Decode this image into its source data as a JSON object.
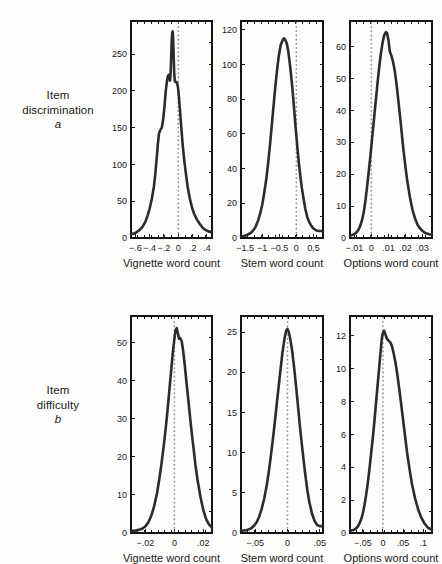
{
  "figure": {
    "background_color": "#fdfdfb",
    "curve_color": "#2b2b2b",
    "axis_color": "#141414",
    "zero_line_color": "#8a8a8a"
  },
  "rows": [
    {
      "line1": "Item",
      "line2": "discrimination",
      "symbol": "a"
    },
    {
      "line1": "Item",
      "line2": "difficulty",
      "symbol": "b"
    }
  ],
  "chart_data": [
    {
      "type": "line",
      "title": "",
      "panel": "top-left",
      "row": "Item discrimination a",
      "xlabel": "Vignette word count",
      "ylabel": "",
      "grid": false,
      "legend": "none",
      "xlim": [
        -0.66,
        0.47
      ],
      "ylim": [
        0,
        295
      ],
      "xticks": [
        -0.6,
        -0.4,
        -0.2,
        0,
        0.2,
        0.4
      ],
      "xticklabels": [
        "−.6",
        "−.4",
        "−.2",
        "0",
        ".2",
        ".4"
      ],
      "yticks": [
        0,
        50,
        100,
        150,
        200,
        250
      ],
      "yticklabels": [
        "0",
        "50",
        "100",
        "150",
        "200",
        "250"
      ],
      "annotations": [
        {
          "type": "vline",
          "x": 0,
          "style": "dotted"
        }
      ],
      "x": [
        -0.66,
        -0.62,
        -0.58,
        -0.54,
        -0.5,
        -0.46,
        -0.43,
        -0.4,
        -0.37,
        -0.34,
        -0.32,
        -0.3,
        -0.285,
        -0.27,
        -0.25,
        -0.23,
        -0.21,
        -0.19,
        -0.175,
        -0.16,
        -0.15,
        -0.14,
        -0.13,
        -0.122,
        -0.115,
        -0.108,
        -0.1,
        -0.092,
        -0.085,
        -0.078,
        -0.072,
        -0.065,
        -0.058,
        -0.05,
        -0.042,
        -0.035,
        -0.025,
        -0.015,
        -0.005,
        0.005,
        0.02,
        0.04,
        0.06,
        0.08,
        0.1,
        0.13,
        0.16,
        0.19,
        0.22,
        0.26,
        0.3,
        0.34,
        0.38,
        0.42,
        0.46
      ],
      "y": [
        5,
        6,
        8,
        11,
        15,
        22,
        30,
        40,
        53,
        70,
        88,
        110,
        128,
        142,
        147,
        150,
        162,
        182,
        200,
        212,
        218,
        221,
        222,
        216,
        214,
        222,
        245,
        268,
        279,
        281,
        270,
        248,
        226,
        214,
        212,
        212,
        212,
        210,
        205,
        196,
        178,
        152,
        128,
        108,
        92,
        70,
        54,
        42,
        33,
        25,
        19,
        14,
        11,
        9,
        8
      ]
    },
    {
      "type": "line",
      "title": "",
      "panel": "top-middle",
      "row": "Item discrimination a",
      "xlabel": "Stem word count",
      "ylabel": "",
      "grid": false,
      "legend": "none",
      "xlim": [
        -1.62,
        0.78
      ],
      "ylim": [
        0,
        125
      ],
      "xticks": [
        -1.5,
        -1,
        -0.5,
        0,
        0.5
      ],
      "xticklabels": [
        "−1.5",
        "−1",
        "−0.5",
        "0",
        "0.5"
      ],
      "yticks": [
        0,
        20,
        40,
        60,
        80,
        100,
        120
      ],
      "yticklabels": [
        "0",
        "20",
        "40",
        "60",
        "80",
        "100",
        "120"
      ],
      "annotations": [
        {
          "type": "vline",
          "x": 0,
          "style": "dotted"
        }
      ],
      "x": [
        -1.62,
        -1.55,
        -1.48,
        -1.42,
        -1.36,
        -1.3,
        -1.24,
        -1.18,
        -1.12,
        -1.06,
        -1.0,
        -0.94,
        -0.88,
        -0.82,
        -0.76,
        -0.7,
        -0.64,
        -0.58,
        -0.52,
        -0.46,
        -0.4,
        -0.36,
        -0.32,
        -0.28,
        -0.24,
        -0.2,
        -0.16,
        -0.12,
        -0.08,
        -0.04,
        0.0,
        0.04,
        0.08,
        0.12,
        0.16,
        0.2,
        0.26,
        0.32,
        0.38,
        0.44,
        0.5,
        0.56,
        0.62,
        0.68,
        0.74,
        0.78
      ],
      "y": [
        1,
        1.2,
        1.5,
        2,
        2.6,
        3.5,
        5,
        7,
        10,
        14,
        19,
        26,
        34,
        44,
        56,
        69,
        82,
        94,
        104,
        111,
        114,
        115,
        114,
        112,
        108,
        102,
        95,
        87,
        78,
        68,
        59,
        50,
        42,
        35,
        29,
        24,
        17,
        12,
        9,
        7,
        5.5,
        4.6,
        4.2,
        4.0,
        4.0,
        4.0
      ]
    },
    {
      "type": "line",
      "title": "",
      "panel": "top-right",
      "row": "Item discrimination a",
      "xlabel": "Options word count",
      "ylabel": "",
      "grid": false,
      "legend": "none",
      "xlim": [
        -0.0125,
        0.0355
      ],
      "ylim": [
        0,
        68
      ],
      "xticks": [
        -0.01,
        0,
        0.01,
        0.02,
        0.03
      ],
      "xticklabels": [
        "−.01",
        "0",
        ".01",
        ".02",
        ".03"
      ],
      "yticks": [
        0,
        10,
        20,
        30,
        40,
        50,
        60
      ],
      "yticklabels": [
        "0",
        "10",
        "20",
        "30",
        "40",
        "50",
        "60"
      ],
      "annotations": [
        {
          "type": "vline",
          "x": 0,
          "style": "dotted"
        }
      ],
      "x": [
        -0.0125,
        -0.0115,
        -0.0105,
        -0.0095,
        -0.0085,
        -0.0075,
        -0.0065,
        -0.0055,
        -0.0045,
        -0.0035,
        -0.0025,
        -0.0015,
        -0.0005,
        0.0005,
        0.0015,
        0.0025,
        0.0035,
        0.0045,
        0.0055,
        0.0065,
        0.0075,
        0.0085,
        0.0092,
        0.01,
        0.0108,
        0.0118,
        0.0128,
        0.0138,
        0.0148,
        0.016,
        0.0172,
        0.0185,
        0.0198,
        0.021,
        0.0225,
        0.024,
        0.0255,
        0.027,
        0.0285,
        0.03,
        0.0315,
        0.033,
        0.0345,
        0.0355
      ],
      "y": [
        0.8,
        0.9,
        1.1,
        1.4,
        1.9,
        2.6,
        3.8,
        5.5,
        8,
        11.5,
        16,
        21,
        26,
        31.5,
        37,
        42.5,
        48,
        53,
        57.5,
        61,
        63.5,
        64.5,
        64.2,
        62,
        58.5,
        57,
        55,
        52,
        48,
        42,
        36,
        29,
        23,
        18,
        13,
        9,
        6.2,
        4.2,
        3,
        2.2,
        1.6,
        1.3,
        1.1,
        1.0
      ]
    },
    {
      "type": "line",
      "title": "",
      "panel": "bottom-left",
      "row": "Item difficulty b",
      "xlabel": "Vignette word count",
      "ylabel": "",
      "grid": false,
      "legend": "none",
      "xlim": [
        -0.03,
        0.026
      ],
      "ylim": [
        0,
        57
      ],
      "xticks": [
        -0.02,
        0,
        0.02
      ],
      "xticklabels": [
        "−.02",
        "0",
        ".02"
      ],
      "yticks": [
        0,
        10,
        20,
        30,
        40,
        50
      ],
      "yticklabels": [
        "0",
        "10",
        "20",
        "30",
        "40",
        "50"
      ],
      "annotations": [
        {
          "type": "vline",
          "x": 0,
          "style": "dotted"
        }
      ],
      "x": [
        -0.03,
        -0.028,
        -0.026,
        -0.024,
        -0.022,
        -0.02,
        -0.018,
        -0.016,
        -0.014,
        -0.012,
        -0.0105,
        -0.009,
        -0.0075,
        -0.006,
        -0.0048,
        -0.0036,
        -0.0024,
        -0.0012,
        0.0,
        0.0008,
        0.0016,
        0.0024,
        0.0032,
        0.004,
        0.005,
        0.006,
        0.0072,
        0.0085,
        0.01,
        0.0115,
        0.013,
        0.0145,
        0.016,
        0.018,
        0.02,
        0.022,
        0.024,
        0.026
      ],
      "y": [
        0.6,
        0.6,
        0.7,
        0.9,
        1.2,
        1.8,
        2.8,
        4.5,
        7,
        10.5,
        14,
        18,
        22.5,
        27.5,
        32,
        37,
        42,
        47,
        51,
        53.3,
        53.8,
        52.5,
        51,
        51.2,
        50.5,
        48,
        44,
        39,
        33.5,
        28,
        23,
        18,
        14,
        9.5,
        6,
        3.6,
        2.2,
        1.4
      ]
    },
    {
      "type": "line",
      "title": "",
      "panel": "bottom-middle",
      "row": "Item difficulty b",
      "xlabel": "Stem word count",
      "ylabel": "",
      "grid": false,
      "legend": "none",
      "xlim": [
        -0.072,
        0.055
      ],
      "ylim": [
        0,
        27
      ],
      "xticks": [
        -0.05,
        0,
        0.05
      ],
      "xticklabels": [
        "−.05",
        "0",
        ".05"
      ],
      "yticks": [
        0,
        5,
        10,
        15,
        20,
        25
      ],
      "yticklabels": [
        "0",
        "5",
        "10",
        "15",
        "20",
        "25"
      ],
      "annotations": [
        {
          "type": "vline",
          "x": 0,
          "style": "dotted"
        }
      ],
      "x": [
        -0.072,
        -0.068,
        -0.064,
        -0.06,
        -0.056,
        -0.052,
        -0.048,
        -0.044,
        -0.04,
        -0.036,
        -0.032,
        -0.029,
        -0.026,
        -0.023,
        -0.02,
        -0.017,
        -0.014,
        -0.011,
        -0.008,
        -0.005,
        -0.002,
        0.0,
        0.002,
        0.004,
        0.007,
        0.01,
        0.013,
        0.016,
        0.019,
        0.022,
        0.025,
        0.028,
        0.031,
        0.034,
        0.038,
        0.042,
        0.046,
        0.05,
        0.055
      ],
      "y": [
        0.25,
        0.3,
        0.35,
        0.45,
        0.6,
        0.9,
        1.3,
        2.0,
        3.0,
        4.3,
        6.0,
        7.6,
        9.4,
        11.4,
        13.5,
        15.8,
        18.0,
        20.2,
        22.3,
        24.0,
        25.2,
        25.4,
        25.0,
        24.3,
        22.8,
        20.8,
        18.5,
        16.0,
        13.5,
        11.2,
        9.0,
        7.0,
        5.2,
        3.8,
        2.4,
        1.5,
        1.0,
        0.85,
        0.85
      ]
    },
    {
      "type": "line",
      "title": "",
      "panel": "bottom-right",
      "row": "Item difficulty b",
      "xlabel": "Options word count",
      "ylabel": "",
      "grid": false,
      "legend": "none",
      "xlim": [
        -0.082,
        0.122
      ],
      "ylim": [
        0,
        13.2
      ],
      "xticks": [
        -0.05,
        0,
        0.05,
        0.1
      ],
      "xticklabels": [
        "−.05",
        "0",
        ".05",
        ".1"
      ],
      "yticks": [
        0,
        2,
        4,
        6,
        8,
        10,
        12
      ],
      "yticklabels": [
        "0",
        "2",
        "4",
        "6",
        "8",
        "10",
        "12"
      ],
      "annotations": [
        {
          "type": "vline",
          "x": 0,
          "style": "dotted"
        }
      ],
      "x": [
        -0.082,
        -0.078,
        -0.074,
        -0.07,
        -0.066,
        -0.062,
        -0.058,
        -0.054,
        -0.05,
        -0.046,
        -0.042,
        -0.038,
        -0.034,
        -0.03,
        -0.026,
        -0.022,
        -0.018,
        -0.014,
        -0.01,
        -0.006,
        -0.003,
        0.0,
        0.003,
        0.006,
        0.01,
        0.014,
        0.018,
        0.022,
        0.026,
        0.031,
        0.036,
        0.042,
        0.048,
        0.054,
        0.06,
        0.066,
        0.072,
        0.08,
        0.088,
        0.096,
        0.104,
        0.112,
        0.122
      ],
      "y": [
        0.15,
        0.16,
        0.18,
        0.22,
        0.3,
        0.42,
        0.6,
        0.85,
        1.2,
        1.7,
        2.3,
        3.0,
        3.8,
        4.7,
        5.6,
        6.6,
        7.7,
        8.8,
        9.9,
        11.0,
        11.8,
        12.2,
        12.3,
        12.1,
        11.8,
        11.7,
        11.6,
        11.4,
        11.0,
        10.4,
        9.6,
        8.5,
        7.3,
        6.1,
        4.9,
        3.9,
        3.0,
        2.1,
        1.4,
        0.9,
        0.55,
        0.32,
        0.2
      ]
    }
  ]
}
